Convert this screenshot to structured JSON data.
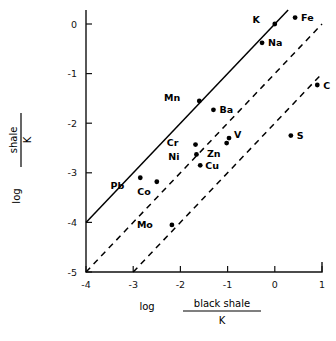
{
  "chart_data": {
    "type": "scatter",
    "title": "",
    "xlabel": "log black shale / K",
    "xlabel_parts": {
      "log": "log",
      "numerator": "black shale",
      "denominator": "K"
    },
    "ylabel": "log shale / K",
    "ylabel_parts": {
      "log": "log",
      "numerator": "shale",
      "denominator": "K"
    },
    "xlim": [
      -4,
      1
    ],
    "ylim": [
      -5,
      0.45
    ],
    "xticks": [
      -4,
      -3,
      -2,
      -1,
      0,
      1
    ],
    "xticklabels": [
      "-4",
      "-3",
      "-2",
      "-1",
      "0",
      "1"
    ],
    "yticks": [
      0,
      -1,
      -2,
      -3,
      -4,
      -5
    ],
    "yticklabels": [
      "0",
      "-1",
      "-2",
      "-3",
      "-4",
      "-5"
    ],
    "grid": false,
    "legend": "none",
    "points": [
      {
        "label": "Fe",
        "x": 0.43,
        "y": 0.13,
        "label_dx": 6,
        "label_dy": 3.5
      },
      {
        "label": "K",
        "x": 0.0,
        "y": 0.0,
        "label_dx": -15,
        "label_dy": -1
      },
      {
        "label": "Na",
        "x": -0.27,
        "y": -0.38,
        "label_dx": 6,
        "label_dy": 3.5
      },
      {
        "label": "C",
        "x": 0.9,
        "y": -1.23,
        "label_dx": 6,
        "label_dy": 3.5
      },
      {
        "label": "Mn",
        "x": -1.6,
        "y": -1.55,
        "label_dx": -19,
        "label_dy": 0
      },
      {
        "label": "Ba",
        "x": -1.3,
        "y": -1.73,
        "label_dx": 6,
        "label_dy": 3.5
      },
      {
        "label": "S",
        "x": 0.34,
        "y": -2.25,
        "label_dx": 6,
        "label_dy": 3.5
      },
      {
        "label": "V",
        "x": -0.97,
        "y": -2.3,
        "label_dx": 5,
        "label_dy": 0
      },
      {
        "label": "Cr",
        "x": -1.68,
        "y": -2.43,
        "label_dx": -17,
        "label_dy": 1
      },
      {
        "label": "Zn",
        "x": -1.02,
        "y": -2.4,
        "label_dx": -6,
        "label_dy": 14
      },
      {
        "label": "Ni",
        "x": -1.66,
        "y": -2.63,
        "label_dx": -17,
        "label_dy": 6
      },
      {
        "label": "Cu",
        "x": -1.58,
        "y": -2.85,
        "label_dx": 5,
        "label_dy": 4
      },
      {
        "label": "Pb",
        "x": -2.85,
        "y": -3.1,
        "label_dx": -16,
        "label_dy": 11
      },
      {
        "label": "Co",
        "x": -2.5,
        "y": -3.18,
        "label_dx": -6,
        "label_dy": 13
      },
      {
        "label": "Mo",
        "x": -2.18,
        "y": -4.05,
        "label_dx": -19,
        "label_dy": 3.5
      }
    ],
    "lines": [
      {
        "name": "one-to-one-line",
        "style": "solid",
        "intercept": 0.0,
        "slope": 1,
        "x_start": -4.0,
        "x_end": 0.3
      },
      {
        "name": "offset-minus-one-line",
        "style": "dashed",
        "intercept": -1.0,
        "slope": 1,
        "x_start": -4.0,
        "x_end": 1.0
      },
      {
        "name": "offset-minus-two-line",
        "style": "dashed",
        "intercept": -2.0,
        "slope": 1,
        "x_start": -3.0,
        "x_end": 1.0
      }
    ]
  },
  "axes": {
    "x_title_log": "log",
    "x_title_numerator": "black shale",
    "x_title_denominator": "K",
    "y_title_log": "log",
    "y_title_numerator": "shale",
    "y_title_denominator": "K"
  }
}
